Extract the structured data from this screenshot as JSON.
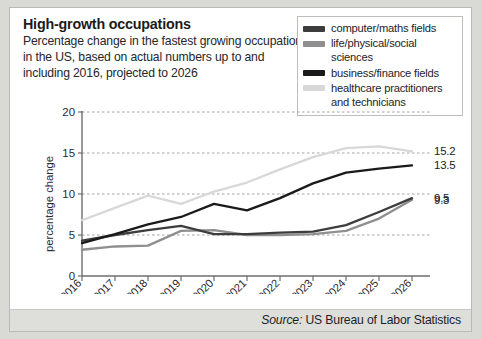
{
  "header": {
    "title": "High-growth occupations",
    "subtitle": "Percentage change in the fastest growing occupations in the US, based on actual numbers up to and including 2016, projected to 2026"
  },
  "legend": {
    "position": "top-right",
    "items": [
      {
        "label": "computer/maths fields",
        "color": "#3d3d3d"
      },
      {
        "label": "life/physical/social sciences",
        "color": "#8f8f8f"
      },
      {
        "label": "business/finance fields",
        "color": "#1a1a1a"
      },
      {
        "label": "healthcare practitioners\nand technicians",
        "color": "#d8d8d8"
      }
    ]
  },
  "source": {
    "prefix": "Source:",
    "text": "US Bureau of Labor Statistics"
  },
  "chart_data": {
    "type": "line",
    "title": "High-growth occupations",
    "xlabel": "",
    "ylabel": "percentage change",
    "x": [
      "2016",
      "2017",
      "2018",
      "2019",
      "2020",
      "2021",
      "2022",
      "2023",
      "2024",
      "2025",
      "2026"
    ],
    "xticklabels": [
      "2016",
      "2017",
      "2018",
      "2019",
      "2020",
      "2021",
      "2022",
      "2023",
      "2024",
      "2025",
      "2026"
    ],
    "yticks": [
      0,
      5,
      10,
      15,
      20
    ],
    "ylim": [
      0,
      20
    ],
    "grid": "horizontal-dashed",
    "series": [
      {
        "name": "computer/maths fields",
        "color": "#3d3d3d",
        "values": [
          4.3,
          5.0,
          5.6,
          6.1,
          5.1,
          5.1,
          5.3,
          5.4,
          6.2,
          7.8,
          9.5
        ],
        "end_label": "9.5"
      },
      {
        "name": "life/physical/social sciences",
        "color": "#8f8f8f",
        "values": [
          3.2,
          3.6,
          3.7,
          5.5,
          5.6,
          5.0,
          5.0,
          5.1,
          5.5,
          7.0,
          9.3
        ],
        "end_label": "9.3"
      },
      {
        "name": "business/finance fields",
        "color": "#1a1a1a",
        "values": [
          4.0,
          5.1,
          6.3,
          7.2,
          8.8,
          8.0,
          9.5,
          11.3,
          12.6,
          13.1,
          13.5
        ],
        "end_label": "13.5"
      },
      {
        "name": "healthcare practitioners and technicians",
        "color": "#d8d8d8",
        "values": [
          6.8,
          8.3,
          9.8,
          8.8,
          10.3,
          11.4,
          13.0,
          14.5,
          15.6,
          15.8,
          15.2
        ],
        "end_label": "15.2"
      }
    ]
  }
}
